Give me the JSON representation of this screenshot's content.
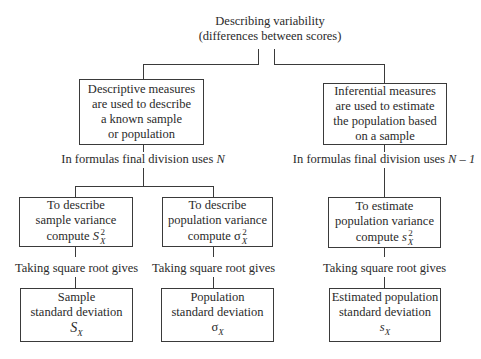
{
  "title": {
    "line1": "Describing variability",
    "line2": "(differences between scores)"
  },
  "descriptive": {
    "box_lines": [
      "Descriptive measures",
      "are used to describe",
      "a known sample",
      "or population"
    ],
    "division_label_prefix": "In formulas final division uses ",
    "division_symbol": "N",
    "sample_variance": {
      "lines": [
        "To describe",
        "sample variance"
      ],
      "compute_label": "compute ",
      "symbol": "S",
      "superscript": "2",
      "subscript": "X"
    },
    "population_variance": {
      "lines": [
        "To describe",
        "population variance"
      ],
      "compute_label": "compute ",
      "symbol": "σ",
      "superscript": "2",
      "subscript": "X"
    },
    "sample_sd": {
      "lines": [
        "Sample",
        "standard deviation"
      ],
      "symbol": "S",
      "subscript": "X"
    },
    "population_sd": {
      "lines": [
        "Population",
        "standard deviation"
      ],
      "symbol": "σ",
      "subscript": "X"
    }
  },
  "inferential": {
    "box_lines": [
      "Inferential measures",
      "are used to estimate",
      "the population based",
      "on a sample"
    ],
    "division_label_prefix": "In formulas final division uses ",
    "division_symbol": "N – 1",
    "estimated_variance": {
      "lines": [
        "To estimate",
        "population variance"
      ],
      "compute_label": "compute ",
      "symbol": "s",
      "superscript": "2",
      "subscript": "X"
    },
    "estimated_sd": {
      "lines": [
        "Estimated population",
        "standard deviation"
      ],
      "symbol": "s",
      "subscript": "X"
    }
  },
  "connector_label": "Taking square root gives"
}
